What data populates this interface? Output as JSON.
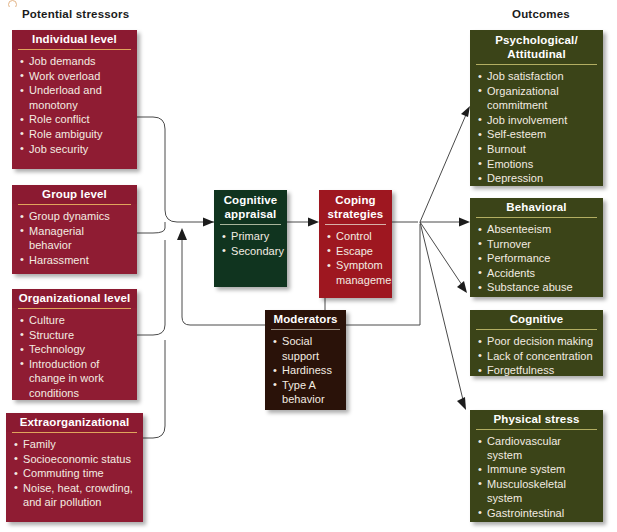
{
  "caption_sliver": "",
  "columns": {
    "left_title": "Potential stressors",
    "right_title": "Outcomes"
  },
  "colors": {
    "stressor_box": "#8f1c33",
    "stressor_rule": "#e0a55c",
    "outcome_box": "#3b4418",
    "outcome_rule": "#b3ae62",
    "appraisal_box": "#10341f",
    "coping_box": "#9e1720",
    "moderators_box": "#2a1209",
    "connector": "#4a4a4a",
    "text": "#f3ece2"
  },
  "stressors": [
    {
      "title": "Individual level",
      "items": [
        {
          "text": "Job demands",
          "cont": false
        },
        {
          "text": "Work overload",
          "cont": false
        },
        {
          "text": "Underload and",
          "cont": false
        },
        {
          "text": "monotony",
          "cont": true
        },
        {
          "text": "Role conflict",
          "cont": false
        },
        {
          "text": "Role ambiguity",
          "cont": false
        },
        {
          "text": "Job security",
          "cont": false
        }
      ]
    },
    {
      "title": "Group level",
      "items": [
        {
          "text": "Group dynamics",
          "cont": false
        },
        {
          "text": "Managerial",
          "cont": false
        },
        {
          "text": "behavior",
          "cont": true
        },
        {
          "text": "Harassment",
          "cont": false
        }
      ]
    },
    {
      "title": "Organizational level",
      "items": [
        {
          "text": "Culture",
          "cont": false
        },
        {
          "text": "Structure",
          "cont": false
        },
        {
          "text": "Technology",
          "cont": false
        },
        {
          "text": "Introduction of",
          "cont": false
        },
        {
          "text": "change in work",
          "cont": true
        },
        {
          "text": "conditions",
          "cont": true
        }
      ]
    },
    {
      "title": "Extraorganizational",
      "items": [
        {
          "text": "Family",
          "cont": false
        },
        {
          "text": "Socioeconomic status",
          "cont": false
        },
        {
          "text": "Commuting time",
          "cont": false
        },
        {
          "text": "Noise, heat, crowding,",
          "cont": false
        },
        {
          "text": "and air pollution",
          "cont": true
        }
      ]
    }
  ],
  "center": {
    "appraisal": {
      "title_line1": "Cognitive",
      "title_line2": "appraisal",
      "items": [
        {
          "text": "Primary",
          "cont": false
        },
        {
          "text": "Secondary",
          "cont": false
        }
      ]
    },
    "coping": {
      "title_line1": "Coping",
      "title_line2": "strategies",
      "items": [
        {
          "text": "Control",
          "cont": false
        },
        {
          "text": "Escape",
          "cont": false
        },
        {
          "text": "Symptom",
          "cont": false
        },
        {
          "text": "management",
          "cont": true
        }
      ]
    },
    "moderators": {
      "title": "Moderators",
      "items": [
        {
          "text": "Social",
          "cont": false
        },
        {
          "text": "support",
          "cont": true
        },
        {
          "text": "Hardiness",
          "cont": false
        },
        {
          "text": "Type A",
          "cont": false
        },
        {
          "text": "behavior",
          "cont": true
        }
      ]
    }
  },
  "outcomes": [
    {
      "title_line1": "Psychological/",
      "title_line2": "Attitudinal",
      "items": [
        {
          "text": "Job satisfaction",
          "cont": false
        },
        {
          "text": "Organizational",
          "cont": false
        },
        {
          "text": "commitment",
          "cont": true
        },
        {
          "text": "Job involvement",
          "cont": false
        },
        {
          "text": "Self-esteem",
          "cont": false
        },
        {
          "text": "Burnout",
          "cont": false
        },
        {
          "text": "Emotions",
          "cont": false
        },
        {
          "text": "Depression",
          "cont": false
        }
      ]
    },
    {
      "title_line1": "Behavioral",
      "title_line2": "",
      "items": [
        {
          "text": "Absenteeism",
          "cont": false
        },
        {
          "text": "Turnover",
          "cont": false
        },
        {
          "text": "Performance",
          "cont": false
        },
        {
          "text": "Accidents",
          "cont": false
        },
        {
          "text": "Substance abuse",
          "cont": false
        },
        {
          "text": "Violence",
          "cont": false
        }
      ]
    },
    {
      "title_line1": "Cognitive",
      "title_line2": "",
      "items": [
        {
          "text": "Poor decision making",
          "cont": false
        },
        {
          "text": "Lack of concentration",
          "cont": false
        },
        {
          "text": "Forgetfulness",
          "cont": false
        }
      ]
    },
    {
      "title_line1": "Physical stress",
      "title_line2": "",
      "items": [
        {
          "text": "Cardiovascular system",
          "cont": false
        },
        {
          "text": "Immune system",
          "cont": false
        },
        {
          "text": "Musculoskeletal",
          "cont": false
        },
        {
          "text": "system",
          "cont": true
        },
        {
          "text": "Gastrointestinal",
          "cont": false
        },
        {
          "text": "system",
          "cont": true
        }
      ]
    }
  ]
}
